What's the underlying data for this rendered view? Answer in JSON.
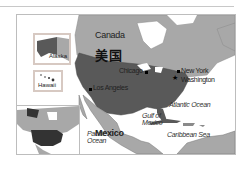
{
  "map": {
    "title_country": "美国",
    "labels": {
      "canada": "Canada",
      "mexico": "Mexico",
      "alaska": "Alaska",
      "hawaii": "Hawaii"
    },
    "cities": [
      {
        "name": "Chicago",
        "marker": "dot"
      },
      {
        "name": "Los Angeles",
        "marker": "dot"
      },
      {
        "name": "New York",
        "marker": "dot"
      },
      {
        "name": "Washington",
        "marker": "star"
      }
    ],
    "water": {
      "atlantic": "Atlantic Ocean",
      "pacific_line1": "Pacific",
      "pacific_line2": "Ocean",
      "gulf_line1": "Gulf of",
      "gulf_line2": "Mexico",
      "caribbean": "Caribbean Sea"
    },
    "colors": {
      "usa": "#595959",
      "land": "#a8a8a8",
      "water": "#ffffff",
      "inset_border": "#d7c9c2"
    }
  }
}
